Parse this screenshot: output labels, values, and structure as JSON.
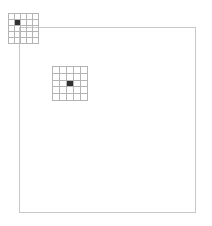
{
  "figure": {
    "background_color": "#ffffff",
    "width": 212,
    "height": 226
  },
  "outer_frame": {
    "name": "feature-map-frame",
    "x": 19,
    "y": 27,
    "width": 177,
    "height": 186,
    "border_color": "#c8c8c8",
    "border_width": 1,
    "fill": "none"
  },
  "grid_windows": [
    {
      "name": "kernel-window-top-left",
      "x": 8,
      "y": 13,
      "width": 31,
      "height": 31,
      "rows": 5,
      "cols": 5,
      "line_color": "#b4b4b4",
      "line_width": 1,
      "active_cell": {
        "row": 1,
        "col": 1
      },
      "active_color": "#303030"
    },
    {
      "name": "kernel-window-center",
      "x": 52,
      "y": 66,
      "width": 36,
      "height": 35,
      "rows": 5,
      "cols": 5,
      "line_color": "#b4b4b4",
      "line_width": 1,
      "active_cell": {
        "row": 2,
        "col": 2
      },
      "active_color": "#303030"
    }
  ],
  "chart_data": {
    "type": "heatmap",
    "title": "",
    "xlabel": "",
    "ylabel": "",
    "grid": true,
    "legend": "none",
    "windows": [
      {
        "name": "kernel-window-top-left",
        "rows": 5,
        "cols": 5,
        "values": [
          [
            0,
            0,
            0,
            0,
            0
          ],
          [
            0,
            1,
            0,
            0,
            0
          ],
          [
            0,
            0,
            0,
            0,
            0
          ],
          [
            0,
            0,
            0,
            0,
            0
          ],
          [
            0,
            0,
            0,
            0,
            0
          ]
        ]
      },
      {
        "name": "kernel-window-center",
        "rows": 5,
        "cols": 5,
        "values": [
          [
            0,
            0,
            0,
            0,
            0
          ],
          [
            0,
            0,
            0,
            0,
            0
          ],
          [
            0,
            0,
            1,
            0,
            0
          ],
          [
            0,
            0,
            0,
            0,
            0
          ],
          [
            0,
            0,
            0,
            0,
            0
          ]
        ]
      }
    ]
  }
}
